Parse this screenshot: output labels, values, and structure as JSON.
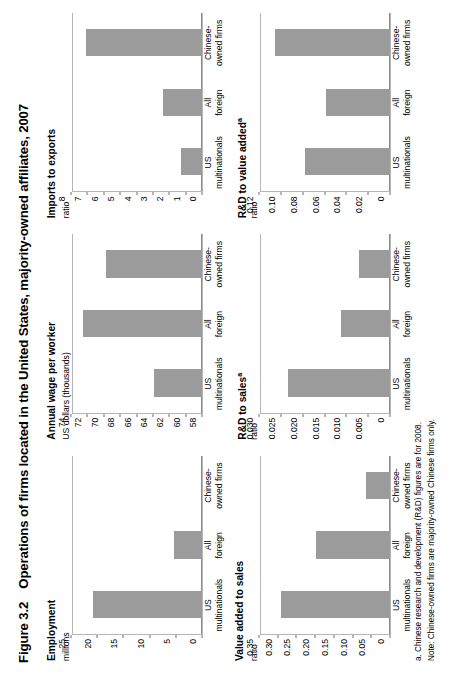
{
  "figure": {
    "number": "Figure 3.2",
    "title": "Operations of firms located in the United States, majority-owned affiliates, 2007"
  },
  "categories": [
    {
      "line1": "US",
      "line2": "multinationals"
    },
    {
      "line1": "All",
      "line2": "foreign"
    },
    {
      "line1": "Chinese-",
      "line2": "owned firms"
    }
  ],
  "footnotes": [
    "a. Chinese research and development (R&D) figures are for 2008.",
    "Note: Chinese-owned firms are majority-owned Chinese firms only."
  ],
  "colors": {
    "bar": "#9b9b9b",
    "axis": "#b5b5b5",
    "text": "#000000"
  },
  "chart_data": [
    {
      "id": "employment",
      "type": "bar",
      "title": "Employment",
      "title_sup": "",
      "ylabel": "millions",
      "categories": [
        "US multinationals",
        "All foreign",
        "Chinese-owned firms"
      ],
      "values": [
        21.1,
        5.4,
        0.0
      ],
      "ylim": [
        0,
        25
      ],
      "yticks": [
        0,
        5,
        10,
        15,
        20,
        25
      ],
      "ytick_labels": [
        "0",
        "5",
        "10",
        "15",
        "20",
        "25"
      ],
      "grid": false,
      "legend": "none"
    },
    {
      "id": "annual-wage-per-worker",
      "type": "bar",
      "title": "Annual wage per worker",
      "title_sup": "",
      "ylabel": "US dollars (thousands)",
      "categories": [
        "US multinationals",
        "All foreign",
        "Chinese-owned firms"
      ],
      "values": [
        64.0,
        72.7,
        69.9
      ],
      "ylim": [
        58,
        74
      ],
      "yticks": [
        58,
        60,
        62,
        64,
        66,
        68,
        70,
        72,
        74
      ],
      "ytick_labels": [
        "58",
        "60",
        "62",
        "64",
        "66",
        "68",
        "70",
        "72",
        "74"
      ],
      "grid": false,
      "legend": "none"
    },
    {
      "id": "imports-to-exports",
      "type": "bar",
      "title": "Imports to exports",
      "title_sup": "",
      "ylabel": "ratio",
      "categories": [
        "US multinationals",
        "All foreign",
        "Chinese-owned firms"
      ],
      "values": [
        1.3,
        2.4,
        7.2
      ],
      "ylim": [
        0,
        8
      ],
      "yticks": [
        0,
        1,
        2,
        3,
        4,
        5,
        6,
        7,
        8
      ],
      "ytick_labels": [
        "0",
        "1",
        "2",
        "3",
        "4",
        "5",
        "6",
        "7",
        "8"
      ],
      "grid": false,
      "legend": "none"
    },
    {
      "id": "value-added-to-sales",
      "type": "bar",
      "title": "Value added to sales",
      "title_sup": "",
      "ylabel": "ratio",
      "categories": [
        "US multinationals",
        "All foreign",
        "Chinese-owned firms"
      ],
      "values": [
        0.295,
        0.2,
        0.065
      ],
      "ylim": [
        0,
        0.35
      ],
      "yticks": [
        0,
        0.05,
        0.1,
        0.15,
        0.2,
        0.25,
        0.3,
        0.35
      ],
      "ytick_labels": [
        "0",
        "0.05",
        "0.10",
        "0.15",
        "0.20",
        "0.25",
        "0.30",
        "0.35"
      ],
      "grid": false,
      "legend": "none"
    },
    {
      "id": "rd-to-sales",
      "type": "bar",
      "title": "R&D to sales",
      "title_sup": "a",
      "ylabel": "ratio",
      "categories": [
        "US multinationals",
        "All foreign",
        "Chinese-owned firms"
      ],
      "values": [
        0.0238,
        0.0115,
        0.0073
      ],
      "ylim": [
        0,
        0.03
      ],
      "yticks": [
        0,
        0.005,
        0.01,
        0.015,
        0.02,
        0.025,
        0.03
      ],
      "ytick_labels": [
        "0",
        "0.005",
        "0.010",
        "0.015",
        "0.020",
        "0.025",
        "0.030"
      ],
      "grid": false,
      "legend": "none"
    },
    {
      "id": "rd-to-value-added",
      "type": "bar",
      "title": "R&D to value added",
      "title_sup": "a",
      "ylabel": "ratio",
      "categories": [
        "US multinationals",
        "All foreign",
        "Chinese-owned firms"
      ],
      "values": [
        0.079,
        0.06,
        0.107
      ],
      "ylim": [
        0,
        0.12
      ],
      "yticks": [
        0,
        0.02,
        0.04,
        0.06,
        0.08,
        0.1,
        0.12
      ],
      "ytick_labels": [
        "0",
        "0.02",
        "0.04",
        "0.06",
        "0.08",
        "0.10",
        "0.12"
      ],
      "grid": false,
      "legend": "none"
    }
  ]
}
